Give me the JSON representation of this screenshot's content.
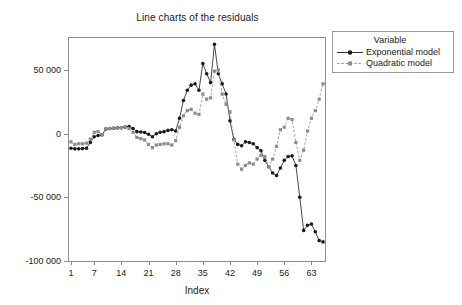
{
  "chart_data": {
    "type": "line",
    "title": "Line charts of the residuals",
    "xlabel": "Index",
    "ylabel": "",
    "grid": false,
    "legend_position": "right",
    "legend_title": "Variable",
    "xlim": [
      0.5,
      66.5
    ],
    "ylim": [
      -100000,
      75000
    ],
    "xticks": [
      1,
      7,
      14,
      21,
      28,
      35,
      42,
      49,
      56,
      63
    ],
    "ytick_labels": [
      "50 000",
      "0",
      "-50 000",
      "-100 000"
    ],
    "yticks": [
      50000,
      0,
      -50000,
      -100000
    ],
    "x": [
      1,
      2,
      3,
      4,
      5,
      6,
      7,
      8,
      9,
      10,
      11,
      12,
      13,
      14,
      15,
      16,
      17,
      18,
      19,
      20,
      21,
      22,
      23,
      24,
      25,
      26,
      27,
      28,
      29,
      30,
      31,
      32,
      33,
      34,
      35,
      36,
      37,
      38,
      39,
      40,
      41,
      42,
      43,
      44,
      45,
      46,
      47,
      48,
      49,
      50,
      51,
      52,
      53,
      54,
      55,
      56,
      57,
      58,
      59,
      60,
      61,
      62,
      63,
      64,
      65,
      66
    ],
    "series": [
      {
        "name": "Exponential model",
        "color": "#1a1a1a",
        "marker": "circle",
        "linestyle": "solid",
        "values": [
          -11500,
          -12000,
          -12000,
          -11800,
          -11500,
          -7000,
          -2500,
          -1500,
          -1000,
          3500,
          4000,
          4200,
          4500,
          4600,
          5200,
          5500,
          4000,
          1500,
          1200,
          800,
          -500,
          -2500,
          -100,
          1000,
          1500,
          2500,
          3000,
          2000,
          12000,
          26000,
          34000,
          38000,
          39000,
          34000,
          55000,
          47000,
          40000,
          70000,
          47000,
          39000,
          31000,
          10000,
          -4500,
          -8500,
          -9500,
          -6500,
          -7000,
          -8000,
          -11000,
          -13500,
          -21000,
          -26000,
          -31000,
          -33000,
          -27000,
          -21000,
          -18000,
          -17500,
          -25000,
          -50000,
          -76000,
          -72000,
          -71000,
          -77000,
          -84000,
          -85000
        ]
      },
      {
        "name": "Quadratic model",
        "color": "#8c8c8c",
        "marker": "square",
        "linestyle": "dashed",
        "values": [
          -6500,
          -8500,
          -8000,
          -8000,
          -7500,
          -4500,
          1000,
          1500,
          -1000,
          3500,
          4000,
          4200,
          4500,
          4600,
          5000,
          4000,
          1000,
          -3000,
          -4000,
          -5000,
          -8500,
          -11000,
          -9000,
          -8500,
          -8000,
          -8000,
          -9000,
          -5500,
          5000,
          14000,
          18000,
          19000,
          16000,
          15000,
          31000,
          27000,
          28000,
          49000,
          50000,
          31000,
          23000,
          17000,
          -5000,
          -24000,
          -28000,
          -25000,
          -23000,
          -24000,
          -20000,
          -17000,
          -18000,
          -26000,
          -20000,
          -10000,
          3000,
          5000,
          12000,
          11000,
          -7000,
          -21000,
          -13000,
          2000,
          12000,
          18000,
          27000,
          39000
        ]
      }
    ]
  }
}
